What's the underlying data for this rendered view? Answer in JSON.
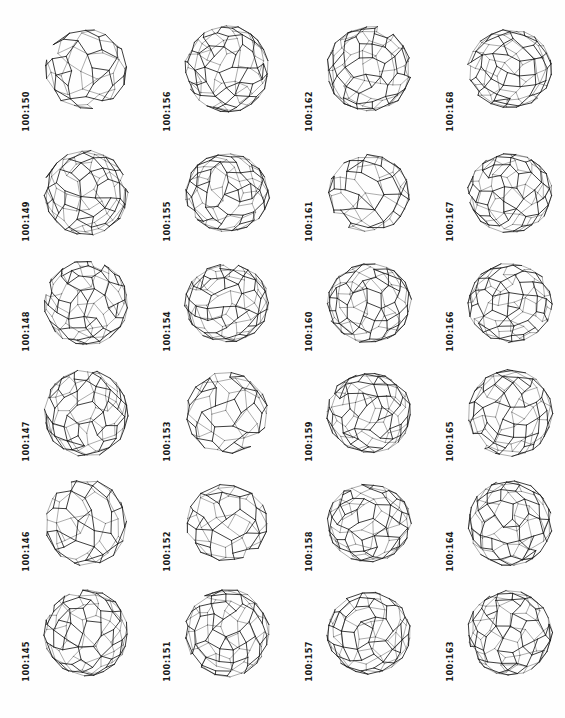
{
  "page": {
    "kind": "fullerene-isomer-plate",
    "background_color": "#fefefe",
    "ink_color": "#1c1c1c",
    "columns": 4,
    "rows": 6,
    "total_structures": 24
  },
  "structures": [
    {
      "label": "100:150",
      "row": 1,
      "col": 1,
      "atoms": 100,
      "isomer": 150,
      "style": "sparse"
    },
    {
      "label": "100:156",
      "row": 1,
      "col": 2,
      "atoms": 100,
      "isomer": 156,
      "style": "dense"
    },
    {
      "label": "100:162",
      "row": 1,
      "col": 3,
      "atoms": 100,
      "isomer": 162,
      "style": "dense"
    },
    {
      "label": "100:168",
      "row": 1,
      "col": 4,
      "atoms": 100,
      "isomer": 168,
      "style": "dense"
    },
    {
      "label": "100:149",
      "row": 2,
      "col": 1,
      "atoms": 100,
      "isomer": 149,
      "style": "dense"
    },
    {
      "label": "100:155",
      "row": 2,
      "col": 2,
      "atoms": 100,
      "isomer": 155,
      "style": "dense"
    },
    {
      "label": "100:161",
      "row": 2,
      "col": 3,
      "atoms": 100,
      "isomer": 161,
      "style": "sparse"
    },
    {
      "label": "100:167",
      "row": 2,
      "col": 4,
      "atoms": 100,
      "isomer": 167,
      "style": "dense"
    },
    {
      "label": "100:148",
      "row": 3,
      "col": 1,
      "atoms": 100,
      "isomer": 148,
      "style": "dense"
    },
    {
      "label": "100:154",
      "row": 3,
      "col": 2,
      "atoms": 100,
      "isomer": 154,
      "style": "dense"
    },
    {
      "label": "100:160",
      "row": 3,
      "col": 3,
      "atoms": 100,
      "isomer": 160,
      "style": "dense"
    },
    {
      "label": "100:166",
      "row": 3,
      "col": 4,
      "atoms": 100,
      "isomer": 166,
      "style": "dense"
    },
    {
      "label": "100:147",
      "row": 4,
      "col": 1,
      "atoms": 100,
      "isomer": 147,
      "style": "dense"
    },
    {
      "label": "100:153",
      "row": 4,
      "col": 2,
      "atoms": 100,
      "isomer": 153,
      "style": "sparse"
    },
    {
      "label": "100:159",
      "row": 4,
      "col": 3,
      "atoms": 100,
      "isomer": 159,
      "style": "dense"
    },
    {
      "label": "100:165",
      "row": 4,
      "col": 4,
      "atoms": 100,
      "isomer": 165,
      "style": "dense"
    },
    {
      "label": "100:146",
      "row": 5,
      "col": 1,
      "atoms": 100,
      "isomer": 146,
      "style": "sparse"
    },
    {
      "label": "100:152",
      "row": 5,
      "col": 2,
      "atoms": 100,
      "isomer": 152,
      "style": "sparse"
    },
    {
      "label": "100:158",
      "row": 5,
      "col": 3,
      "atoms": 100,
      "isomer": 158,
      "style": "dense"
    },
    {
      "label": "100:164",
      "row": 5,
      "col": 4,
      "atoms": 100,
      "isomer": 164,
      "style": "dense"
    },
    {
      "label": "100:145",
      "row": 6,
      "col": 1,
      "atoms": 100,
      "isomer": 145,
      "style": "dense"
    },
    {
      "label": "100:151",
      "row": 6,
      "col": 2,
      "atoms": 100,
      "isomer": 151,
      "style": "dense"
    },
    {
      "label": "100:157",
      "row": 6,
      "col": 3,
      "atoms": 100,
      "isomer": 157,
      "style": "dense"
    },
    {
      "label": "100:163",
      "row": 6,
      "col": 4,
      "atoms": 100,
      "isomer": 163,
      "style": "dense"
    }
  ]
}
